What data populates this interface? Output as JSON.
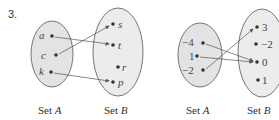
{
  "problem_number": "3.",
  "diagrams": [
    {
      "set_a_label": "Set",
      "set_a_var": "A",
      "set_b_label": "Set",
      "set_b_var": "B",
      "set_a": [
        "a",
        "c",
        "k"
      ],
      "set_b": [
        "s",
        "t",
        "r",
        "p"
      ],
      "mappings": [
        [
          "a",
          "t"
        ],
        [
          "c",
          "s"
        ],
        [
          "k",
          "p"
        ]
      ]
    },
    {
      "set_a_label": "Set",
      "set_a_var": "A",
      "set_b_label": "Set",
      "set_b_var": "B",
      "set_a": [
        "−4",
        "1",
        "−2"
      ],
      "set_b": [
        "3",
        "−2",
        "0",
        "1"
      ],
      "mappings": [
        [
          "-4",
          "0"
        ],
        [
          "1",
          "0"
        ],
        [
          "-2",
          "3"
        ]
      ]
    }
  ],
  "colors": {
    "set_a_fill": "#e3e3e3",
    "set_b_fill": "#ececec",
    "stroke": "#555555"
  }
}
